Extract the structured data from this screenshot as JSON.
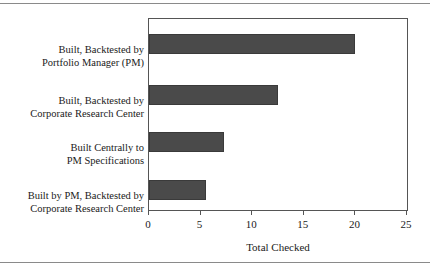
{
  "chart_data": {
    "type": "bar",
    "orientation": "horizontal",
    "title": "",
    "xlabel": "Total Checked",
    "ylabel": "",
    "xlim": [
      0,
      25
    ],
    "xticks": [
      0,
      5,
      10,
      15,
      20,
      25
    ],
    "xtick_labels": [
      "0",
      "5",
      "10",
      "15",
      "20",
      "25"
    ],
    "grid": false,
    "legend": null,
    "bar_color": "#4a4a4a",
    "frame_color": "#555555",
    "categories": [
      "Built, Backtested by Portfolio Manager (PM)",
      "Built, Backtested by Corporate Research Center",
      "Built Centrally to PM Specifications",
      "Built by PM, Backtested by Corporate Research Center"
    ],
    "category_lines": [
      [
        "Built, Backtested by",
        "Portfolio Manager (PM)"
      ],
      [
        "Built, Backtested by",
        "Corporate Research Center"
      ],
      [
        "Built Centrally to",
        "PM Specifications"
      ],
      [
        "Built by PM, Backtested by",
        "Corporate Research Center"
      ]
    ],
    "values": [
      20,
      12.5,
      7.3,
      5.5
    ]
  }
}
